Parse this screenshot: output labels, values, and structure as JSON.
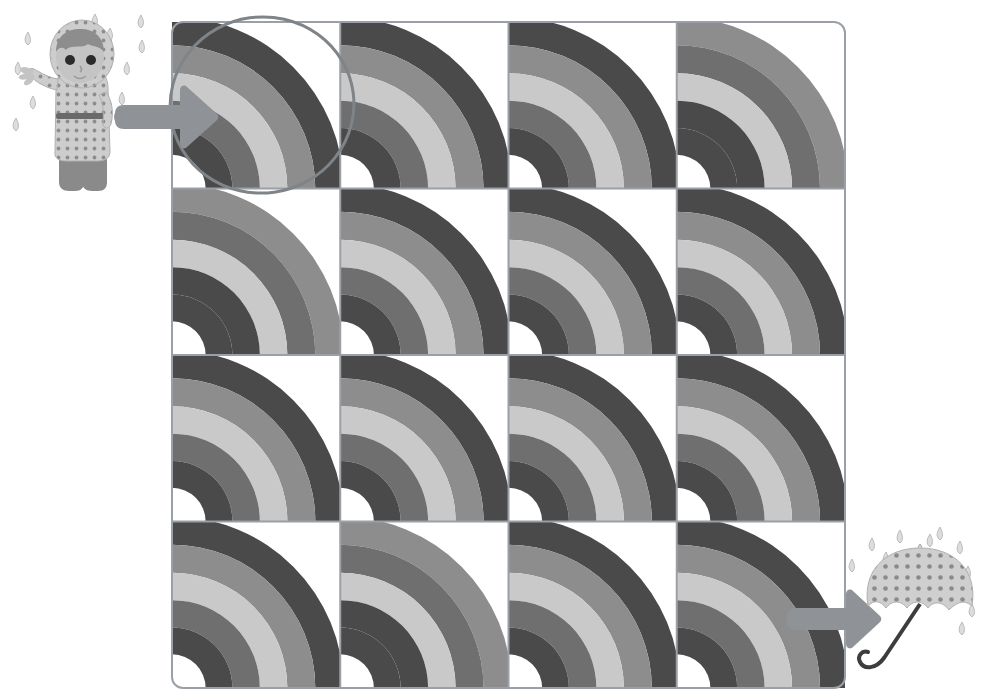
{
  "worksheet": {
    "title": "Rainbow Pattern Tracing Grid",
    "type": "visual-pattern-worksheet",
    "background_color": "#ffffff"
  },
  "palette": {
    "grid_line": "#9aa0a6",
    "band_dark": "#4a4a4a",
    "band_mid_dark": "#6f6f6f",
    "band_mid": "#8d8d8d",
    "band_light": "#c9c9c9",
    "band_lightest": "#d8d8d8",
    "arrow": "#8f9296",
    "circle_marker": "#7e8488",
    "raindrop": "#d2d2d2",
    "raindrop_outline": "#b4b4b4",
    "skin": "#c4c4c4",
    "hair": "#8d8d8d",
    "coat": "#cdcdcd",
    "coat_dot": "#8d8d8d",
    "boot": "#8a8a8a",
    "belt": "#6a6a6a",
    "eye": "#2b2b2b",
    "umbrella_canopy": "#cfcfcf",
    "umbrella_dot": "#8a8a8a",
    "umbrella_handle": "#3d3d3d"
  },
  "grid": {
    "label": "rainbow-grid",
    "columns": 4,
    "rows": 4,
    "x": 172,
    "y": 22,
    "width": 673,
    "height": 666,
    "corner_radius": 10,
    "cells": [
      {
        "row": 1,
        "col": 1,
        "variant": "dark-outside",
        "center": "bottom-left"
      },
      {
        "row": 1,
        "col": 2,
        "variant": "dark-outside",
        "center": "bottom-left"
      },
      {
        "row": 1,
        "col": 3,
        "variant": "dark-outside",
        "center": "bottom-left"
      },
      {
        "row": 1,
        "col": 4,
        "variant": "light-outside",
        "center": "bottom-left"
      },
      {
        "row": 2,
        "col": 1,
        "variant": "light-outside",
        "center": "bottom-left"
      },
      {
        "row": 2,
        "col": 2,
        "variant": "dark-outside",
        "center": "bottom-left"
      },
      {
        "row": 2,
        "col": 3,
        "variant": "dark-outside",
        "center": "bottom-left"
      },
      {
        "row": 2,
        "col": 4,
        "variant": "dark-outside",
        "center": "bottom-left"
      },
      {
        "row": 3,
        "col": 1,
        "variant": "dark-outside",
        "center": "bottom-left"
      },
      {
        "row": 3,
        "col": 2,
        "variant": "dark-outside",
        "center": "bottom-left"
      },
      {
        "row": 3,
        "col": 3,
        "variant": "dark-outside",
        "center": "bottom-left"
      },
      {
        "row": 3,
        "col": 4,
        "variant": "dark-outside",
        "center": "bottom-left"
      },
      {
        "row": 4,
        "col": 1,
        "variant": "dark-outside",
        "center": "bottom-left"
      },
      {
        "row": 4,
        "col": 2,
        "variant": "light-outside",
        "center": "bottom-left"
      },
      {
        "row": 4,
        "col": 3,
        "variant": "dark-outside",
        "center": "bottom-left"
      },
      {
        "row": 4,
        "col": 4,
        "variant": "dark-outside",
        "center": "bottom-left"
      }
    ],
    "band_order_dark_outside": [
      "band_dark",
      "band_mid",
      "band_light",
      "band_mid_dark",
      "band_dark"
    ],
    "band_order_light_outside": [
      "band_mid",
      "band_mid_dark",
      "band_light",
      "band_dark",
      "band_dark"
    ]
  },
  "markers": {
    "start_circle": {
      "label": "start-circle-marker",
      "cx": 262,
      "cy": 105,
      "rx": 92,
      "ry": 88,
      "rotation": -8,
      "stroke_width": 3
    },
    "start_arrow": {
      "label": "start-arrow",
      "x": 122,
      "y": 90,
      "width": 96,
      "height": 54,
      "direction": "right"
    },
    "end_arrow": {
      "label": "end-arrow",
      "x": 790,
      "y": 592,
      "width": 88,
      "height": 52,
      "direction": "right"
    }
  },
  "figures": {
    "child": {
      "label": "child-in-raincoat",
      "x": 8,
      "y": 14,
      "width": 150,
      "height": 196,
      "description": "child wearing polka-dot hooded raincoat and boots, waving"
    },
    "umbrella": {
      "label": "open-umbrella",
      "x": 848,
      "y": 540,
      "width": 130,
      "height": 150,
      "description": "open polka-dot umbrella with curved handle"
    },
    "rain_left": {
      "label": "raindrops-left",
      "count": 12
    },
    "rain_right": {
      "label": "raindrops-right",
      "count": 13
    }
  }
}
